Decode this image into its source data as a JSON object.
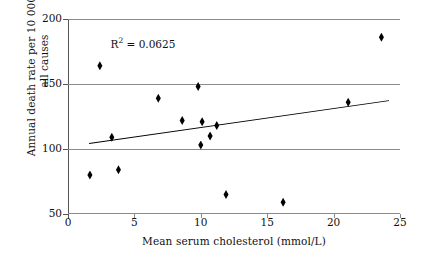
{
  "chart_data": {
    "type": "scatter",
    "title": "",
    "xlabel": "Mean serum cholesterol (mmol/L)",
    "ylabel": "Annual death rate per 10 000 men,\nall causes",
    "xlim": [
      0,
      25
    ],
    "ylim": [
      50,
      200
    ],
    "xticks": [
      0,
      5,
      10,
      15,
      20,
      25
    ],
    "yticks": [
      50,
      100,
      150,
      200
    ],
    "xtick_labels": [
      "0",
      "5",
      "10",
      "15",
      "20",
      "25"
    ],
    "ytick_labels": [
      "50",
      "100",
      "150",
      "200"
    ],
    "grid": "horizontal",
    "legend": "none",
    "points": [
      {
        "x": 1.65,
        "y": 80
      },
      {
        "x": 2.4,
        "y": 164
      },
      {
        "x": 3.3,
        "y": 109
      },
      {
        "x": 3.8,
        "y": 84
      },
      {
        "x": 6.8,
        "y": 139
      },
      {
        "x": 8.6,
        "y": 122
      },
      {
        "x": 9.8,
        "y": 148
      },
      {
        "x": 10.0,
        "y": 103
      },
      {
        "x": 10.1,
        "y": 121
      },
      {
        "x": 10.7,
        "y": 110
      },
      {
        "x": 11.2,
        "y": 118
      },
      {
        "x": 11.9,
        "y": 65
      },
      {
        "x": 16.2,
        "y": 59
      },
      {
        "x": 21.1,
        "y": 136
      },
      {
        "x": 23.6,
        "y": 186
      }
    ],
    "trendline": {
      "x_start": 1.6,
      "y_start": 105,
      "x_end": 24.2,
      "y_end": 138
    },
    "annotations": [
      {
        "name": "r-squared",
        "text_prefix": "R",
        "text_sup": "2",
        "text_suffix": " = 0.0625",
        "value": 0.0625,
        "x": 3.2,
        "y": 187
      }
    ],
    "colors": {
      "marker": "#000000",
      "trendline": "#000000",
      "gridline": "#8a8a8a",
      "axis": "#555555",
      "background": "#ffffff",
      "text": "#111111"
    }
  }
}
